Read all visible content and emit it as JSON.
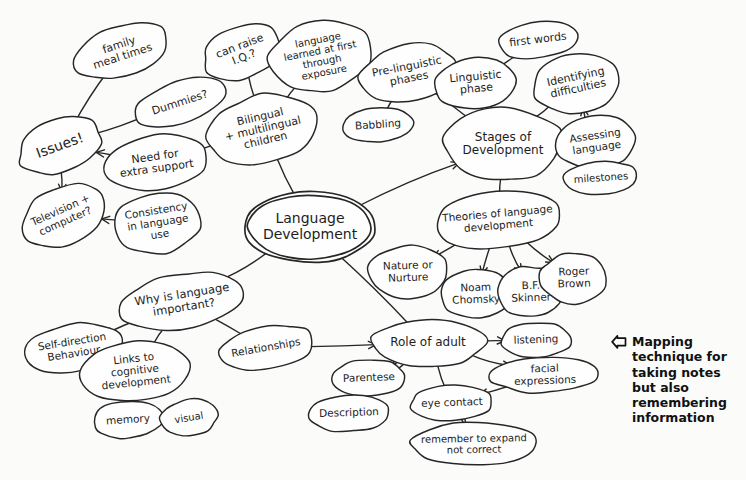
{
  "document": {
    "title": "Language Development Mind Map",
    "background_color": "#fbfbf9",
    "ink_color": "#262626"
  },
  "annotation": {
    "icon": "arrow-left-icon",
    "text": "Mapping\ntechnique for\ntaking notes\nbut also\nremembering\ninformation"
  },
  "central": {
    "label": "Language\nDevelopment"
  },
  "nodes": [
    {
      "id": "family-meal-times",
      "label": "family\nmeal times",
      "x": 78,
      "y": 30,
      "w": 86,
      "h": 42,
      "rot": -18,
      "fs": 11
    },
    {
      "id": "dummies",
      "label": "Dummies?",
      "x": 138,
      "y": 86,
      "w": 84,
      "h": 34,
      "rot": -18,
      "fs": 11
    },
    {
      "id": "issues",
      "label": "Issues!",
      "x": 22,
      "y": 124,
      "w": 76,
      "h": 44,
      "rot": -20,
      "fs": 14
    },
    {
      "id": "television-computer",
      "label": "Television +\ncomputer?",
      "x": 24,
      "y": 192,
      "w": 78,
      "h": 48,
      "rot": -24,
      "fs": 10.5
    },
    {
      "id": "need-extra-support",
      "label": "Need for\nextra support",
      "x": 110,
      "y": 140,
      "w": 92,
      "h": 46,
      "rot": -8,
      "fs": 11
    },
    {
      "id": "consistency-language-use",
      "label": "Consistency\nin language\nuse",
      "x": 118,
      "y": 197,
      "w": 80,
      "h": 52,
      "rot": -9,
      "fs": 10.5
    },
    {
      "id": "can-raise-iq",
      "label": "can raise\nI.Q.?",
      "x": 207,
      "y": 30,
      "w": 70,
      "h": 44,
      "rot": -21,
      "fs": 11
    },
    {
      "id": "bilingual-multilingual",
      "label": "Bilingual\n+ multilingual\nchildren",
      "x": 212,
      "y": 100,
      "w": 102,
      "h": 58,
      "rot": -13,
      "fs": 11
    },
    {
      "id": "language-first-exposure",
      "label": "language\nlearned at first\nthrough\nexposure",
      "x": 273,
      "y": 25,
      "w": 96,
      "h": 62,
      "rot": -11,
      "fs": 10
    },
    {
      "id": "pre-linguistic-phases",
      "label": "Pre-linguistic\nphases",
      "x": 364,
      "y": 50,
      "w": 88,
      "h": 46,
      "rot": -11,
      "fs": 11
    },
    {
      "id": "babbling",
      "label": "Babbling",
      "x": 347,
      "y": 112,
      "w": 62,
      "h": 26,
      "rot": -4,
      "fs": 10.5
    },
    {
      "id": "linguistic-phase",
      "label": "Linguistic\nphase",
      "x": 440,
      "y": 62,
      "w": 72,
      "h": 42,
      "rot": -5,
      "fs": 11
    },
    {
      "id": "first-words",
      "label": "first words",
      "x": 502,
      "y": 26,
      "w": 72,
      "h": 28,
      "rot": -7,
      "fs": 11
    },
    {
      "id": "stages-of-development",
      "label": "Stages of\nDevelopment",
      "x": 448,
      "y": 113,
      "w": 110,
      "h": 62,
      "rot": 0,
      "fs": 12
    },
    {
      "id": "identifying-difficulties",
      "label": "Identifying\ndifficulties",
      "x": 537,
      "y": 58,
      "w": 80,
      "h": 50,
      "rot": -12,
      "fs": 11
    },
    {
      "id": "assessing-language",
      "label": "Assessing\nlanguage",
      "x": 561,
      "y": 120,
      "w": 70,
      "h": 44,
      "rot": -8,
      "fs": 10.5
    },
    {
      "id": "milestones",
      "label": "milestones",
      "x": 568,
      "y": 166,
      "w": 66,
      "h": 24,
      "rot": -4,
      "fs": 10
    },
    {
      "id": "theories-of-language",
      "label": "Theories of language\ndevelopment",
      "x": 438,
      "y": 197,
      "w": 120,
      "h": 46,
      "rot": -5,
      "fs": 10.5
    },
    {
      "id": "nature-or-nurture",
      "label": "Nature or\nNurture",
      "x": 373,
      "y": 251,
      "w": 70,
      "h": 42,
      "rot": -2,
      "fs": 10.5
    },
    {
      "id": "noam-chomsky",
      "label": "Noam\nChomsky",
      "x": 445,
      "y": 274,
      "w": 62,
      "h": 40,
      "rot": -2,
      "fs": 10.5
    },
    {
      "id": "bf-skinner",
      "label": "B.F.\nSkinner",
      "x": 503,
      "y": 271,
      "w": 56,
      "h": 42,
      "rot": -2,
      "fs": 10.5
    },
    {
      "id": "roger-brown",
      "label": "Roger\nBrown",
      "x": 545,
      "y": 257,
      "w": 58,
      "h": 42,
      "rot": -2,
      "fs": 10.5
    },
    {
      "id": "why-is-language-important",
      "label": "Why is language\nimportant?",
      "x": 124,
      "y": 278,
      "w": 118,
      "h": 46,
      "rot": -9,
      "fs": 11.5
    },
    {
      "id": "self-direction-behaviour",
      "label": "Self-direction\nBehaviour",
      "x": 29,
      "y": 329,
      "w": 88,
      "h": 38,
      "rot": -9,
      "fs": 10.5
    },
    {
      "id": "links-to-cognitive",
      "label": "Links to\ncognitive\ndevelopment",
      "x": 85,
      "y": 345,
      "w": 100,
      "h": 52,
      "rot": -6,
      "fs": 10.5
    },
    {
      "id": "memory",
      "label": "memory",
      "x": 97,
      "y": 406,
      "w": 62,
      "h": 28,
      "rot": -4,
      "fs": 10.5
    },
    {
      "id": "visual",
      "label": "visual",
      "x": 165,
      "y": 404,
      "w": 48,
      "h": 28,
      "rot": -9,
      "fs": 10
    },
    {
      "id": "relationships",
      "label": "Relationships",
      "x": 222,
      "y": 331,
      "w": 88,
      "h": 34,
      "rot": -10,
      "fs": 10.5
    },
    {
      "id": "role-of-adult",
      "label": "Role of adult",
      "x": 376,
      "y": 324,
      "w": 104,
      "h": 38,
      "rot": 0,
      "fs": 12
    },
    {
      "id": "listening",
      "label": "listening",
      "x": 505,
      "y": 327,
      "w": 62,
      "h": 26,
      "rot": -2,
      "fs": 10.5
    },
    {
      "id": "facial-expressions",
      "label": "facial expressions",
      "x": 496,
      "y": 362,
      "w": 98,
      "h": 26,
      "rot": -2,
      "fs": 10.5
    },
    {
      "id": "parentese",
      "label": "Parentese",
      "x": 337,
      "y": 364,
      "w": 64,
      "h": 28,
      "rot": -2,
      "fs": 10.5
    },
    {
      "id": "description",
      "label": "Description",
      "x": 313,
      "y": 399,
      "w": 72,
      "h": 28,
      "rot": -2,
      "fs": 10.5
    },
    {
      "id": "eye-contact",
      "label": "eye contact",
      "x": 416,
      "y": 390,
      "w": 72,
      "h": 26,
      "rot": -2,
      "fs": 10.5
    },
    {
      "id": "remember-to-expand",
      "label": "remember to expand\nnot correct",
      "x": 415,
      "y": 427,
      "w": 118,
      "h": 34,
      "rot": -1,
      "fs": 10
    }
  ],
  "edges": [
    {
      "from": "issues",
      "to": "family-meal-times",
      "arrow": false
    },
    {
      "from": "issues",
      "to": "dummies",
      "arrow": false
    },
    {
      "from": "issues",
      "to": "television-computer",
      "arrow": true
    },
    {
      "from": "need-extra-support",
      "to": "issues",
      "arrow": true
    },
    {
      "from": "consistency-language-use",
      "to": "television-computer",
      "arrow": true
    },
    {
      "from": "bilingual-multilingual",
      "to": "can-raise-iq",
      "arrow": false
    },
    {
      "from": "bilingual-multilingual",
      "to": "language-first-exposure",
      "arrow": false
    },
    {
      "from": "bilingual-multilingual",
      "to": "need-extra-support",
      "arrow": false
    },
    {
      "from": "central",
      "to": "bilingual-multilingual",
      "arrow": false
    },
    {
      "from": "central",
      "to": "stages-of-development",
      "arrow": true
    },
    {
      "from": "central",
      "to": "why-is-language-important",
      "arrow": false
    },
    {
      "from": "central",
      "to": "role-of-adult",
      "arrow": false
    },
    {
      "from": "stages-of-development",
      "to": "pre-linguistic-phases",
      "arrow": false
    },
    {
      "from": "pre-linguistic-phases",
      "to": "babbling",
      "arrow": false
    },
    {
      "from": "pre-linguistic-phases",
      "to": "linguistic-phase",
      "arrow": true
    },
    {
      "from": "linguistic-phase",
      "to": "first-words",
      "arrow": false
    },
    {
      "from": "stages-of-development",
      "to": "identifying-difficulties",
      "arrow": false
    },
    {
      "from": "stages-of-development",
      "to": "assessing-language",
      "arrow": false
    },
    {
      "from": "assessing-language",
      "to": "milestones",
      "arrow": true
    },
    {
      "from": "milestones",
      "to": "identifying-difficulties",
      "arrow": true
    },
    {
      "from": "stages-of-development",
      "to": "theories-of-language",
      "arrow": false
    },
    {
      "from": "theories-of-language",
      "to": "nature-or-nurture",
      "arrow": true
    },
    {
      "from": "theories-of-language",
      "to": "noam-chomsky",
      "arrow": true
    },
    {
      "from": "theories-of-language",
      "to": "bf-skinner",
      "arrow": true
    },
    {
      "from": "theories-of-language",
      "to": "roger-brown",
      "arrow": true
    },
    {
      "from": "why-is-language-important",
      "to": "self-direction-behaviour",
      "arrow": true
    },
    {
      "from": "why-is-language-important",
      "to": "links-to-cognitive",
      "arrow": false
    },
    {
      "from": "why-is-language-important",
      "to": "relationships",
      "arrow": false
    },
    {
      "from": "links-to-cognitive",
      "to": "memory",
      "arrow": false
    },
    {
      "from": "memory",
      "to": "visual",
      "arrow": false
    },
    {
      "from": "relationships",
      "to": "role-of-adult",
      "arrow": true
    },
    {
      "from": "role-of-adult",
      "to": "listening",
      "arrow": true
    },
    {
      "from": "role-of-adult",
      "to": "facial-expressions",
      "arrow": true
    },
    {
      "from": "role-of-adult",
      "to": "parentese",
      "arrow": true
    },
    {
      "from": "role-of-adult",
      "to": "description",
      "arrow": true
    },
    {
      "from": "role-of-adult",
      "to": "remember-to-expand",
      "arrow": true
    },
    {
      "from": "facial-expressions",
      "to": "eye-contact",
      "arrow": true
    }
  ]
}
